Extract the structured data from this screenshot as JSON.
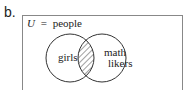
{
  "problem_label": "b.",
  "universe": {
    "symbol": "U",
    "equals": "=",
    "label": "people"
  },
  "sets": [
    {
      "name": "girls",
      "lines": [
        "girls"
      ]
    },
    {
      "name": "math likers",
      "lines": [
        "math",
        "likers"
      ]
    }
  ],
  "shaded_region": "intersection",
  "colors": {
    "stroke": "#333333",
    "box": "#888888",
    "hatch": "#444444"
  }
}
